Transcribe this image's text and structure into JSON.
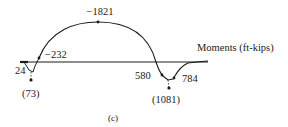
{
  "diagram": {
    "axis_label": "Moments (ft-kips)",
    "caption": "(c)",
    "points": {
      "left_end": "24",
      "left_min": "(73)",
      "inflection_left": "−232",
      "peak": "−1821",
      "right_start": "580",
      "right_min": "(1081)",
      "right_end": "784"
    },
    "colors": {
      "line": "#1a1a1a",
      "background": "#ffffff"
    }
  }
}
